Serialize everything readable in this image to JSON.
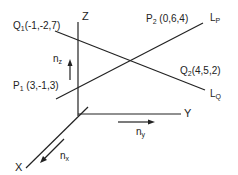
{
  "diagram": {
    "axes": {
      "x": "X",
      "y": "Y",
      "z": "Z"
    },
    "normals": {
      "nx": {
        "base": "n",
        "sub": "x"
      },
      "ny": {
        "base": "n",
        "sub": "y"
      },
      "nz": {
        "base": "n",
        "sub": "z"
      }
    },
    "lines": {
      "LP": {
        "base": "L",
        "sub": "P"
      },
      "LQ": {
        "base": "L",
        "sub": "Q"
      }
    },
    "points": {
      "Q1": {
        "base": "Q",
        "sub": "1",
        "coords": "(-1,-2,7)"
      },
      "Q2": {
        "base": "Q",
        "sub": "2",
        "coords": "(4,5,2)"
      },
      "P1": {
        "base": "P",
        "sub": "1",
        "coords": "(3,-1,3)"
      },
      "P2": {
        "base": "P",
        "sub": "2",
        "coords": "(0,6,4)"
      }
    },
    "line_color": "#222222"
  }
}
